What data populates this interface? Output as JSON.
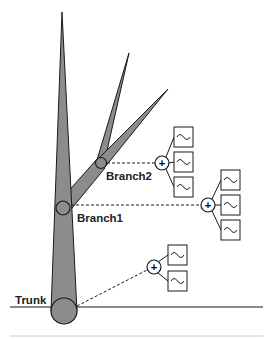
{
  "diagram": {
    "labels": {
      "trunk": "Trunk",
      "branch1": "Branch1",
      "branch2": "Branch2"
    },
    "summing_node_symbol": "+",
    "oscillator_symbol": "~",
    "nodes": [
      {
        "name": "Trunk",
        "oscillators": 2
      },
      {
        "name": "Branch1",
        "oscillators": 3
      },
      {
        "name": "Branch2",
        "oscillators": 3
      }
    ],
    "colors": {
      "tree_fill": "#8c8c8c",
      "stroke": "#1a1a1a",
      "background": "#ffffff",
      "footer_rule": "#cccccc"
    }
  }
}
